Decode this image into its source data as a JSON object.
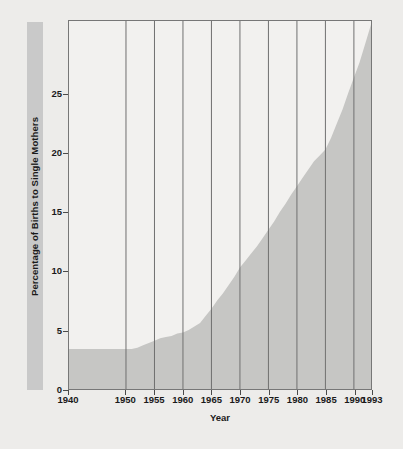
{
  "chart_data": {
    "type": "area",
    "title": "",
    "xlabel": "Year",
    "ylabel": "Percentage of Births to Single Mothers",
    "xlim": [
      1940,
      1993
    ],
    "ylim": [
      0,
      31.2
    ],
    "grid": "vertical",
    "legend": "none",
    "xticks": [
      1940,
      1950,
      1955,
      1960,
      1965,
      1970,
      1975,
      1980,
      1985,
      1990,
      1993
    ],
    "xtick_labels": [
      "1940",
      "1950",
      "1955",
      "1960",
      "1965",
      "1970",
      "1975",
      "1980",
      "1985",
      "1990",
      "1993"
    ],
    "yticks": [
      0,
      5,
      10,
      15,
      20,
      25
    ],
    "ytick_labels": [
      "0",
      "5",
      "10",
      "15",
      "20",
      "25"
    ],
    "series": [
      {
        "name": "Percentage of Births to Single Mothers",
        "fill_color": "#c6c6c4",
        "x": [
          1940,
          1941,
          1942,
          1943,
          1944,
          1945,
          1946,
          1947,
          1948,
          1949,
          1950,
          1951,
          1952,
          1953,
          1954,
          1955,
          1956,
          1957,
          1958,
          1959,
          1960,
          1961,
          1962,
          1963,
          1964,
          1965,
          1966,
          1967,
          1968,
          1969,
          1970,
          1971,
          1972,
          1973,
          1974,
          1975,
          1976,
          1977,
          1978,
          1979,
          1980,
          1981,
          1982,
          1983,
          1984,
          1985,
          1986,
          1987,
          1988,
          1989,
          1990,
          1991,
          1992,
          1993
        ],
        "values": [
          3.4,
          3.4,
          3.4,
          3.4,
          3.4,
          3.4,
          3.4,
          3.4,
          3.4,
          3.4,
          3.4,
          3.4,
          3.5,
          3.7,
          3.9,
          4.1,
          4.3,
          4.4,
          4.5,
          4.7,
          4.8,
          5.0,
          5.3,
          5.6,
          6.2,
          6.8,
          7.5,
          8.1,
          8.8,
          9.5,
          10.3,
          10.9,
          11.5,
          12.1,
          12.8,
          13.5,
          14.2,
          15.0,
          15.7,
          16.5,
          17.2,
          17.9,
          18.6,
          19.3,
          19.8,
          20.3,
          21.3,
          22.5,
          23.7,
          25.1,
          26.4,
          27.7,
          29.3,
          30.9
        ]
      }
    ]
  },
  "axes": {
    "x_title": "Year",
    "y_title": "Percentage of Births to Single Mothers"
  }
}
